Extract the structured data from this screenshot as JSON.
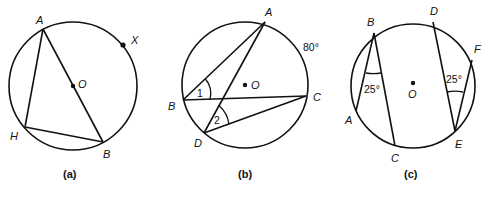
{
  "figures": [
    {
      "id": "a",
      "caption": "(a)",
      "labels": {
        "A": "A",
        "X": "X",
        "O": "O",
        "H": "H",
        "B": "B"
      }
    },
    {
      "id": "b",
      "caption": "(b)",
      "labels": {
        "A": "A",
        "O": "O",
        "B": "B",
        "C": "C",
        "D": "D"
      },
      "angle_labels": {
        "angle1": "1",
        "angle2": "2"
      },
      "arc_label": "80°"
    },
    {
      "id": "c",
      "caption": "(c)",
      "labels": {
        "B": "B",
        "A": "A",
        "C": "C",
        "D": "D",
        "F": "F",
        "E": "E",
        "O": "O"
      },
      "angle_labels": {
        "angle_B": "25°",
        "angle_E": "25°"
      }
    }
  ]
}
